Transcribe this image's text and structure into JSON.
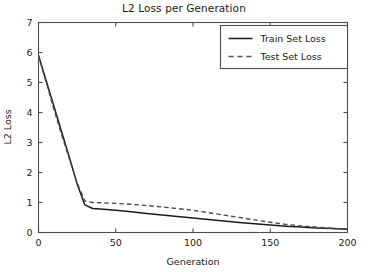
{
  "chart_data": {
    "type": "line",
    "title": "L2 Loss per Generation",
    "xlabel": "Generation",
    "ylabel": "L2 Loss",
    "xlim": [
      0,
      200
    ],
    "ylim": [
      0,
      7
    ],
    "xticks": [
      0,
      50,
      100,
      150,
      200
    ],
    "yticks": [
      0,
      1,
      2,
      3,
      4,
      5,
      6,
      7
    ],
    "grid": false,
    "legend_position": "upper right",
    "x": [
      0,
      5,
      10,
      15,
      20,
      25,
      30,
      35,
      40,
      50,
      60,
      70,
      80,
      90,
      100,
      110,
      120,
      130,
      140,
      150,
      160,
      170,
      180,
      190,
      200
    ],
    "series": [
      {
        "name": "Train Set Loss",
        "style": "solid",
        "color": "#1a1a1a",
        "values": [
          5.9,
          5.05,
          4.2,
          3.35,
          2.5,
          1.62,
          0.92,
          0.8,
          0.78,
          0.74,
          0.69,
          0.63,
          0.58,
          0.53,
          0.48,
          0.43,
          0.38,
          0.33,
          0.29,
          0.25,
          0.21,
          0.18,
          0.15,
          0.13,
          0.11
        ]
      },
      {
        "name": "Test Set Loss",
        "style": "dashed",
        "color": "#4d4d4d",
        "values": [
          5.9,
          5.0,
          4.1,
          3.25,
          2.45,
          1.65,
          1.05,
          1.0,
          0.99,
          0.97,
          0.94,
          0.9,
          0.85,
          0.8,
          0.74,
          0.66,
          0.58,
          0.5,
          0.42,
          0.34,
          0.27,
          0.22,
          0.18,
          0.14,
          0.12
        ]
      }
    ]
  },
  "legend": {
    "entries": [
      {
        "label": "Train Set Loss"
      },
      {
        "label": "Test Set Loss"
      }
    ]
  }
}
